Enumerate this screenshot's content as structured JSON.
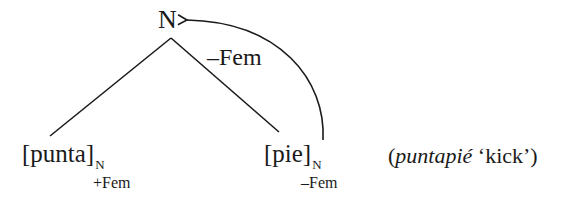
{
  "diagram": {
    "type": "morphology-tree",
    "root": {
      "label": "N"
    },
    "arc": {
      "label": "–Fem",
      "direction": "from [pie] head to root N"
    },
    "leaves": [
      {
        "stem": "[punta]",
        "category": "N",
        "feature": "+Fem"
      },
      {
        "stem": "[pie]",
        "category": "N",
        "feature": "–Fem"
      }
    ],
    "gloss": {
      "open": "(",
      "word": "puntapié",
      "translation": " ‘kick’)"
    }
  },
  "colors": {
    "ink": "#1a1a1a",
    "background": "#ffffff"
  }
}
